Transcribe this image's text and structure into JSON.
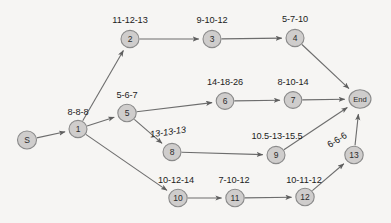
{
  "diagram": {
    "type": "activity-on-node network",
    "background_color": "#f6f5f3",
    "node_fill_color": "#cfcdcc",
    "node_stroke_color": "#8a8a8a",
    "edge_color": "#6d6d6d",
    "node_radius": 8.5,
    "nodes": [
      {
        "id": "S",
        "label": "S",
        "x": 27,
        "y": 140,
        "rx": 9.5,
        "ry": 9.0
      },
      {
        "id": "1",
        "label": "1",
        "x": 78,
        "y": 129,
        "rx": 9.0,
        "ry": 8.6
      },
      {
        "id": "2",
        "label": "2",
        "x": 130,
        "y": 39,
        "rx": 9.0,
        "ry": 8.6
      },
      {
        "id": "3",
        "label": "3",
        "x": 212,
        "y": 39,
        "rx": 9.0,
        "ry": 8.6
      },
      {
        "id": "4",
        "label": "4",
        "x": 295,
        "y": 38,
        "rx": 9.0,
        "ry": 8.6
      },
      {
        "id": "5",
        "label": "5",
        "x": 127,
        "y": 113,
        "rx": 9.2,
        "ry": 8.8
      },
      {
        "id": "6",
        "label": "6",
        "x": 225,
        "y": 101,
        "rx": 8.8,
        "ry": 8.4
      },
      {
        "id": "7",
        "label": "7",
        "x": 293,
        "y": 100,
        "rx": 8.8,
        "ry": 8.4
      },
      {
        "id": "8",
        "label": "8",
        "x": 172,
        "y": 152,
        "rx": 9.0,
        "ry": 8.6
      },
      {
        "id": "9",
        "label": "9",
        "x": 276,
        "y": 155,
        "rx": 9.0,
        "ry": 8.6
      },
      {
        "id": "10",
        "label": "10",
        "x": 178,
        "y": 198,
        "rx": 9.2,
        "ry": 8.8
      },
      {
        "id": "11",
        "label": "11",
        "x": 235,
        "y": 198,
        "rx": 9.2,
        "ry": 8.8
      },
      {
        "id": "12",
        "label": "12",
        "x": 305,
        "y": 197,
        "rx": 9.2,
        "ry": 8.8
      },
      {
        "id": "13",
        "label": "13",
        "x": 354,
        "y": 155,
        "rx": 9.2,
        "ry": 8.8
      },
      {
        "id": "End",
        "label": "End",
        "x": 360,
        "y": 99,
        "rx": 11.0,
        "ry": 9.2
      }
    ],
    "edges": [
      {
        "from": "S",
        "to": "1",
        "label": "8-8-8",
        "label_x": 78,
        "label_y": 112,
        "rotate": 0,
        "italic": false,
        "arrow": true
      },
      {
        "from": "1",
        "to": "2",
        "label": "11-12-13",
        "label_x": 130,
        "label_y": 20,
        "rotate": 0,
        "italic": false,
        "arrow": true
      },
      {
        "from": "2",
        "to": "3",
        "label": "9-10-12",
        "label_x": 212,
        "label_y": 20,
        "rotate": 0,
        "italic": false,
        "arrow": true
      },
      {
        "from": "3",
        "to": "4",
        "label": "5-7-10",
        "label_x": 295,
        "label_y": 19,
        "rotate": 0,
        "italic": false,
        "arrow": true
      },
      {
        "from": "4",
        "to": "End",
        "label": "",
        "label_x": 0,
        "label_y": 0,
        "rotate": 0,
        "italic": false,
        "arrow": true
      },
      {
        "from": "1",
        "to": "5",
        "label": "5-6-7",
        "label_x": 127,
        "label_y": 95,
        "rotate": 0,
        "italic": false,
        "arrow": true
      },
      {
        "from": "5",
        "to": "6",
        "label": "14-18-26",
        "label_x": 225,
        "label_y": 82,
        "rotate": 0,
        "italic": false,
        "arrow": true
      },
      {
        "from": "6",
        "to": "7",
        "label": "8-10-14",
        "label_x": 293,
        "label_y": 82,
        "rotate": 0,
        "italic": false,
        "arrow": true
      },
      {
        "from": "7",
        "to": "End",
        "label": "",
        "label_x": 0,
        "label_y": 0,
        "rotate": 0,
        "italic": false,
        "arrow": true
      },
      {
        "from": "5",
        "to": "8",
        "label": "13-13-13",
        "label_x": 168,
        "label_y": 132,
        "rotate": -8,
        "italic": true,
        "arrow": true
      },
      {
        "from": "8",
        "to": "9",
        "label": "10.5-13-15.5",
        "label_x": 277,
        "label_y": 136,
        "rotate": 0,
        "italic": false,
        "arrow": true
      },
      {
        "from": "9",
        "to": "End",
        "label": "",
        "label_x": 0,
        "label_y": 0,
        "rotate": 0,
        "italic": false,
        "arrow": true
      },
      {
        "from": "1",
        "to": "10",
        "label": "10-12-14",
        "label_x": 176,
        "label_y": 180,
        "rotate": 0,
        "italic": false,
        "arrow": true
      },
      {
        "from": "10",
        "to": "11",
        "label": "7-10-12",
        "label_x": 234,
        "label_y": 180,
        "rotate": 0,
        "italic": false,
        "arrow": true
      },
      {
        "from": "11",
        "to": "12",
        "label": "10-11-12",
        "label_x": 304,
        "label_y": 180,
        "rotate": 0,
        "italic": false,
        "arrow": true
      },
      {
        "from": "12",
        "to": "13",
        "label": "",
        "label_x": 0,
        "label_y": 0,
        "rotate": 0,
        "italic": false,
        "arrow": true
      },
      {
        "from": "13",
        "to": "End",
        "label": "6-6-6",
        "label_x": 337,
        "label_y": 140,
        "rotate": -32,
        "italic": false,
        "arrow": true
      }
    ]
  }
}
